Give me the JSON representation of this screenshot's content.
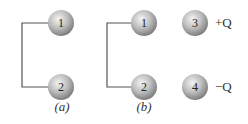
{
  "figure": {
    "panels": [
      {
        "label": "(a)",
        "spheres": [
          {
            "id": "1",
            "cx": 61,
            "cy": 23
          },
          {
            "id": "2",
            "cx": 61,
            "cy": 87
          }
        ],
        "wire_x": 22
      },
      {
        "label": "(b)",
        "spheres": [
          {
            "id": "1",
            "cx": 144,
            "cy": 23
          },
          {
            "id": "2",
            "cx": 144,
            "cy": 87
          },
          {
            "id": "3",
            "cx": 195,
            "cy": 23,
            "charge": "+Q"
          },
          {
            "id": "4",
            "cx": 195,
            "cy": 87,
            "charge": "−Q"
          }
        ],
        "wire_x": 107
      }
    ],
    "colors": {
      "wire": "#555555",
      "sphere_light": "#f2f2f2",
      "sphere_mid": "#b5b5b5",
      "sphere_dark": "#7a7a7a"
    }
  },
  "labels": {
    "a": "(a)",
    "b": "(b)",
    "s1a": "1",
    "s2a": "2",
    "s1b": "1",
    "s2b": "2",
    "s3": "3",
    "s4": "4",
    "plusQ": "+Q",
    "minusQ": "−Q"
  }
}
